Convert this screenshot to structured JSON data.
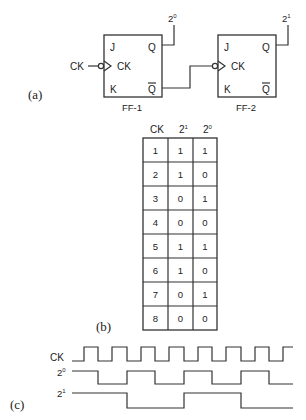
{
  "part_a": {
    "label": "(a)",
    "input_label": "CK",
    "flip_flops": [
      {
        "name": "FF-1",
        "pins": {
          "j": "J",
          "k": "K",
          "ck": "CK",
          "q": "Q",
          "qbar": "Q"
        },
        "output_label": "2",
        "output_exp": "0"
      },
      {
        "name": "FF-2",
        "pins": {
          "j": "J",
          "k": "K",
          "ck": "CK",
          "q": "Q",
          "qbar": "Q"
        },
        "output_label": "2",
        "output_exp": "1"
      }
    ]
  },
  "part_b": {
    "label": "(b)",
    "headers": [
      {
        "base": "CK",
        "exp": ""
      },
      {
        "base": "2",
        "exp": "1"
      },
      {
        "base": "2",
        "exp": "0"
      }
    ],
    "rows": [
      [
        "1",
        "1",
        "1"
      ],
      [
        "2",
        "1",
        "0"
      ],
      [
        "3",
        "0",
        "1"
      ],
      [
        "4",
        "0",
        "0"
      ],
      [
        "5",
        "1",
        "1"
      ],
      [
        "6",
        "1",
        "0"
      ],
      [
        "7",
        "0",
        "1"
      ],
      [
        "8",
        "0",
        "0"
      ]
    ]
  },
  "part_c": {
    "label": "(c)",
    "signals": [
      {
        "base": "CK",
        "exp": ""
      },
      {
        "base": "2",
        "exp": "0"
      },
      {
        "base": "2",
        "exp": "1"
      }
    ]
  },
  "colors": {
    "ink": "#333333",
    "background": "#ffffff"
  }
}
